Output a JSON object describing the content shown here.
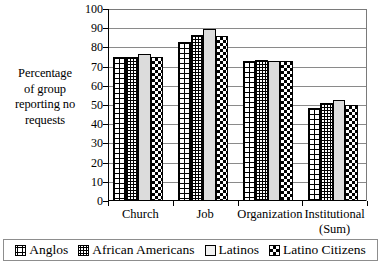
{
  "chart_data": {
    "type": "bar",
    "title": "",
    "xlabel": "",
    "ylabel": "Percentage of group reporting no requests",
    "ylim": [
      0,
      100
    ],
    "ytick_step": 10,
    "yticks": [
      100,
      90,
      80,
      70,
      60,
      50,
      40,
      30,
      20,
      10,
      0
    ],
    "grid": true,
    "legend_position": "bottom",
    "categories": [
      "Church",
      "Job",
      "Organization",
      "Institutional (Sum)"
    ],
    "series": [
      {
        "name": "Anglos",
        "pattern": "coarse-grid",
        "values": [
          75,
          83,
          73,
          48.5
        ]
      },
      {
        "name": "African Americans",
        "pattern": "fine-grid",
        "values": [
          75,
          86.5,
          73.5,
          51
        ]
      },
      {
        "name": "Latinos",
        "pattern": "light-solid",
        "values": [
          76.5,
          89.5,
          73,
          52.5
        ]
      },
      {
        "name": "Latino Citizens",
        "pattern": "checker",
        "values": [
          75,
          86,
          73,
          50
        ]
      }
    ]
  },
  "axis": {
    "title_lines": [
      "Percentage",
      "of group",
      "reporting no",
      "requests"
    ],
    "tick_labels": [
      "100",
      "90",
      "80",
      "70",
      "60",
      "50",
      "40",
      "30",
      "20",
      "10",
      "0"
    ]
  },
  "categories": [
    {
      "label": "Church"
    },
    {
      "label": "Job"
    },
    {
      "label": "Organization"
    },
    {
      "label_line1": "Institutional",
      "label_line2": "(Sum)"
    }
  ],
  "legend": {
    "items": [
      {
        "label": "Anglos",
        "swatch": "coarse-grid-swatch"
      },
      {
        "label": "African Americans",
        "swatch": "fine-grid-swatch"
      },
      {
        "label": "Latinos",
        "swatch": "light-solid-swatch"
      },
      {
        "label": "Latino Citizens",
        "swatch": "checker-swatch"
      }
    ]
  },
  "colors": {
    "ink": "#000000",
    "gridline": "#8a8a8a",
    "latinos_fill": "#dcdcdc",
    "background": "#ffffff"
  }
}
